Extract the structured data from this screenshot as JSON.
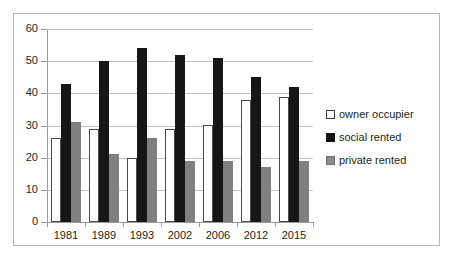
{
  "chart_data": {
    "type": "bar",
    "title": "",
    "subtitle": "",
    "xlabel": "",
    "ylabel": "",
    "categories": [
      "1981",
      "1989",
      "1993",
      "2002",
      "2006",
      "2012",
      "2015"
    ],
    "series": [
      {
        "name": "owner occupier",
        "color": "#ffffff",
        "values": [
          26,
          29,
          20,
          29,
          30,
          38,
          39
        ]
      },
      {
        "name": "social rented",
        "color": "#161616",
        "values": [
          43,
          50,
          54,
          52,
          51,
          45,
          42
        ]
      },
      {
        "name": "private rented",
        "color": "#808080",
        "values": [
          31,
          21,
          26,
          19,
          19,
          17,
          19
        ]
      }
    ],
    "ylim": [
      0,
      60
    ],
    "yticks": [
      0,
      10,
      20,
      30,
      40,
      50,
      60
    ],
    "ytick_labels": [
      "0",
      "10",
      "20",
      "30",
      "40",
      "50",
      "60"
    ],
    "grid": true,
    "legend_position": "right"
  },
  "axis": {
    "y_labels": [
      "60",
      "50",
      "40",
      "30",
      "20",
      "10",
      "0"
    ]
  },
  "legend": {
    "items": [
      {
        "label": "owner occupier",
        "swatch": "owner"
      },
      {
        "label": "social rented",
        "swatch": "social"
      },
      {
        "label": "private rented",
        "swatch": "private"
      }
    ]
  },
  "colors": {
    "owner_occupier": "#ffffff",
    "social_rented": "#161616",
    "private_rented": "#808080",
    "gridline": "#c3c3c3",
    "axis": "#9a9a9a",
    "frame": "#b9b9b9",
    "text": "#231f20"
  }
}
